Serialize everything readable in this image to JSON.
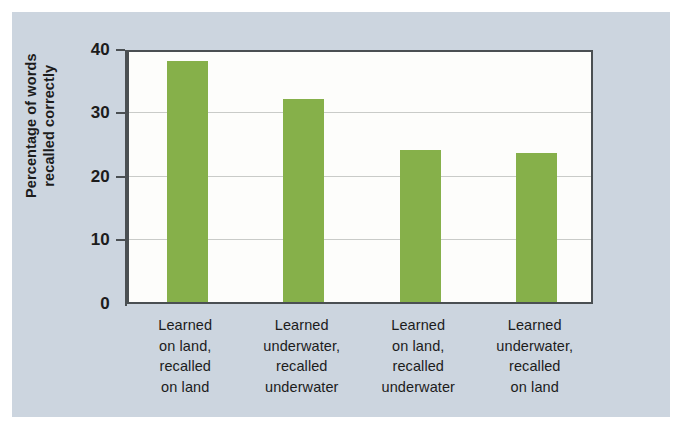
{
  "figure": {
    "panel_color": "#ccd5df",
    "plot_background": "#fdfdfb",
    "bar_color": "#86b04a",
    "axis_color": "#4a4f52",
    "gridline_color": "#c9cbc8"
  },
  "chart_data": {
    "type": "bar",
    "title": "",
    "xlabel": "",
    "ylabel": "Percentage of words recalled correctly",
    "ylim": [
      0,
      40
    ],
    "yticks": [
      0,
      10,
      20,
      30,
      40
    ],
    "ytick_labels": [
      "0",
      "10",
      "20",
      "30",
      "40"
    ],
    "grid": "horizontal",
    "legend": "none",
    "categories": [
      "Learned on land, recalled on land",
      "Learned underwater, recalled underwater",
      "Learned on land, recalled underwater",
      "Learned underwater, recalled on land"
    ],
    "category_lines": [
      [
        "Learned",
        "on land,",
        "recalled",
        "on land"
      ],
      [
        "Learned",
        "underwater,",
        "recalled",
        "underwater"
      ],
      [
        "Learned",
        "on land,",
        "recalled",
        "underwater"
      ],
      [
        "Learned",
        "underwater,",
        "recalled",
        "on land"
      ]
    ],
    "values": [
      38,
      32,
      24,
      23.5
    ],
    "series": [
      {
        "name": "Percentage of words recalled correctly",
        "values": [
          38,
          32,
          24,
          23.5
        ]
      }
    ]
  }
}
